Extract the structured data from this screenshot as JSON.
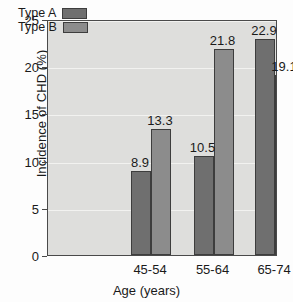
{
  "chart_data": {
    "type": "bar",
    "title": "",
    "subtitle": "",
    "xlabel": "Age (years)",
    "ylabel": "Incidence of CHD (%)",
    "categories": [
      "45-54",
      "55-64",
      "65-74"
    ],
    "series": [
      {
        "name": "Type A",
        "values": [
          8.9,
          10.5,
          22.9
        ],
        "color": "#6f6f6f"
      },
      {
        "name": "Type B",
        "values": [
          13.3,
          21.8,
          19.1
        ],
        "color": "#8c8c8c"
      }
    ],
    "ylim": [
      0,
      25
    ],
    "yticks": [
      0,
      5,
      10,
      15,
      20,
      25
    ],
    "ytick_labels": [
      "0",
      "5",
      "10",
      "15",
      "20",
      "25"
    ],
    "grid": true,
    "grid_axis": "y",
    "legend_position": "upper-left",
    "data_labels": true,
    "plot_background": "#dededc",
    "gridline_color": "#f2f2f0",
    "axis_color": "#4a4a4a",
    "bar_border_color": "#3d3d3d",
    "figure_background": "#fdfdfd"
  },
  "legend": {
    "entries": [
      {
        "label": "Type A",
        "swatch": "#6f6f6f"
      },
      {
        "label": "Type B",
        "swatch": "#8c8c8c"
      }
    ]
  },
  "labels": {
    "g0s0": "8.9",
    "g0s1": "13.3",
    "g1s0": "10.5",
    "g1s1": "21.8",
    "g2s0": "22.9",
    "g2s1": "19.1"
  },
  "yticks": {
    "t0": "0",
    "t1": "5",
    "t2": "10",
    "t3": "15",
    "t4": "20",
    "t5": "25"
  },
  "xcats": {
    "c0": "45-54",
    "c1": "55-64",
    "c2": "65-74"
  }
}
